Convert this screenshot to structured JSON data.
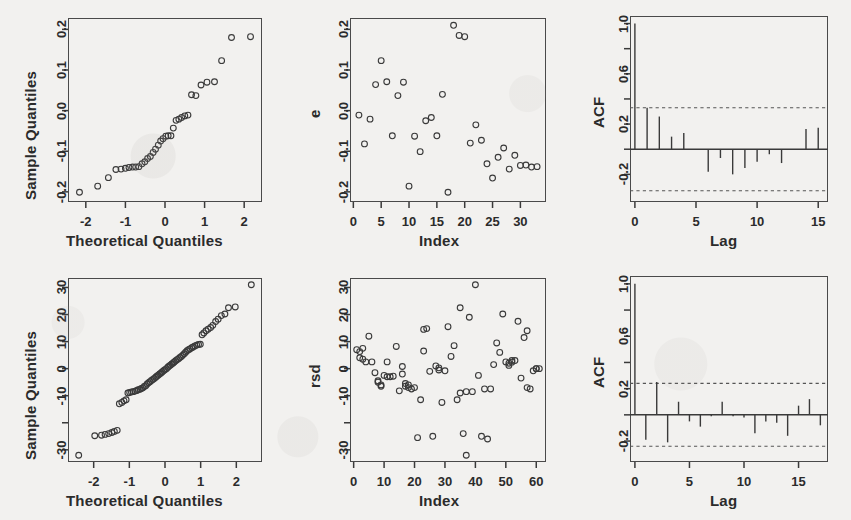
{
  "figure": {
    "kind": "r-diagnostic-panel-grid",
    "rows": 2,
    "cols": 3,
    "background_color": "#f2f1ef",
    "ink_color": "#3a3a3a"
  },
  "chart_data": [
    {
      "id": "top-left-qq",
      "type": "scatter",
      "title": "",
      "xlabel": "Theoretical Quantiles",
      "ylabel": "Sample Quantiles",
      "xlim": [
        -2.45,
        2.45
      ],
      "ylim": [
        -0.225,
        0.228
      ],
      "xticks": [
        -2,
        -1,
        0,
        1,
        2
      ],
      "xticklabels": [
        "-2",
        "-1",
        "0",
        "1",
        "2"
      ],
      "yticks": [
        -0.2,
        -0.1,
        0.0,
        0.1,
        0.2
      ],
      "yticklabels": [
        "-0.2",
        "-0.1",
        "0.0",
        "0.1",
        "0.2"
      ],
      "grid": false,
      "legend": "none",
      "marker": "open-circle",
      "x": [
        -2.16,
        -1.7,
        -1.43,
        -1.24,
        -1.11,
        -1.0,
        -0.91,
        -0.82,
        -0.74,
        -0.66,
        -0.58,
        -0.51,
        -0.44,
        -0.37,
        -0.3,
        -0.24,
        -0.17,
        -0.11,
        -0.05,
        0.02,
        0.08,
        0.15,
        0.21,
        0.28,
        0.35,
        0.42,
        0.5,
        0.58,
        0.67,
        0.78,
        0.91,
        1.06,
        1.25,
        1.43,
        1.68,
        2.16
      ],
      "y": [
        -0.201,
        -0.186,
        -0.165,
        -0.145,
        -0.144,
        -0.142,
        -0.14,
        -0.139,
        -0.139,
        -0.138,
        -0.131,
        -0.126,
        -0.118,
        -0.113,
        -0.103,
        -0.095,
        -0.085,
        -0.075,
        -0.069,
        -0.063,
        -0.062,
        -0.062,
        -0.043,
        -0.024,
        -0.021,
        -0.017,
        -0.013,
        -0.011,
        0.039,
        0.037,
        0.063,
        0.07,
        0.071,
        0.123,
        0.18,
        0.182,
        0.21
      ]
    },
    {
      "id": "top-middle-residuals",
      "type": "scatter",
      "title": "",
      "xlabel": "Index",
      "ylabel": "e",
      "xlim": [
        -0.6,
        34.6
      ],
      "ylim": [
        -0.225,
        0.228
      ],
      "xticks": [
        0,
        5,
        10,
        15,
        20,
        25,
        30
      ],
      "xticklabels": [
        "0",
        "5",
        "10",
        "15",
        "20",
        "25",
        "30"
      ],
      "yticks": [
        -0.2,
        -0.1,
        0.0,
        0.1,
        0.2
      ],
      "yticklabels": [
        "-0.2",
        "-0.1",
        "0.0",
        "0.1",
        "0.2"
      ],
      "grid": false,
      "legend": "none",
      "marker": "open-circle",
      "x": [
        1,
        2,
        3,
        4,
        5,
        6,
        7,
        8,
        9,
        10,
        11,
        12,
        13,
        14,
        15,
        16,
        17,
        18,
        19,
        20,
        21,
        22,
        23,
        24,
        25,
        26,
        27,
        28,
        29,
        30,
        31,
        32,
        33
      ],
      "y": [
        -0.011,
        -0.082,
        -0.021,
        0.064,
        0.123,
        0.071,
        -0.062,
        0.037,
        0.07,
        -0.186,
        -0.063,
        -0.101,
        -0.025,
        -0.017,
        -0.062,
        0.04,
        -0.201,
        0.21,
        0.185,
        0.182,
        -0.08,
        -0.035,
        -0.073,
        -0.131,
        -0.166,
        -0.115,
        -0.092,
        -0.144,
        -0.11,
        -0.135,
        -0.134,
        -0.139,
        -0.138
      ]
    },
    {
      "id": "top-right-acf",
      "type": "bar",
      "title": "",
      "xlabel": "Lag",
      "ylabel": "ACF",
      "xlim": [
        -0.4,
        15.8
      ],
      "ylim": [
        -0.42,
        1.06
      ],
      "xticks": [
        0,
        5,
        10,
        15
      ],
      "xticklabels": [
        "0",
        "5",
        "10",
        "15"
      ],
      "yticks": [
        -0.2,
        0.2,
        0.6,
        1.0
      ],
      "yticklabels": [
        "-0.2",
        "0.2",
        "0.6",
        "1.0"
      ],
      "grid": false,
      "legend": "none",
      "categories": [
        0,
        1,
        2,
        3,
        4,
        5,
        6,
        7,
        8,
        9,
        10,
        11,
        12,
        13,
        14,
        15
      ],
      "values": [
        1.0,
        0.33,
        0.26,
        0.1,
        0.13,
        0.0,
        -0.18,
        -0.07,
        -0.2,
        -0.15,
        -0.1,
        -0.04,
        -0.11,
        0.0,
        0.16,
        0.17
      ],
      "confidence_bounds": [
        0.33,
        -0.33
      ],
      "confidence_line_style": "dashed"
    },
    {
      "id": "bottom-left-qq",
      "type": "scatter",
      "title": "",
      "xlabel": "Theoretical Quantiles",
      "ylabel": "Sample Quantiles",
      "xlim": [
        -2.72,
        2.72
      ],
      "ylim": [
        -34.5,
        33.5
      ],
      "xticks": [
        -2,
        -1,
        0,
        1,
        2
      ],
      "xticklabels": [
        "-2",
        "-1",
        "0",
        "1",
        "2"
      ],
      "yticks": [
        -30,
        -10,
        0,
        10,
        20,
        30
      ],
      "yticklabels": [
        "-30",
        "-10",
        "0",
        "10",
        "20",
        "30"
      ],
      "grid": false,
      "legend": "none",
      "marker": "open-circle",
      "x": [
        -2.42,
        -1.97,
        -1.78,
        -1.68,
        -1.58,
        -1.49,
        -1.42,
        -1.34,
        -1.28,
        -1.21,
        -1.15,
        -1.09,
        -1.04,
        -0.99,
        -0.94,
        -0.89,
        -0.84,
        -0.79,
        -0.75,
        -0.7,
        -0.66,
        -0.62,
        -0.58,
        -0.54,
        -0.5,
        -0.46,
        -0.42,
        -0.38,
        -0.34,
        -0.3,
        -0.26,
        -0.23,
        -0.19,
        -0.15,
        -0.11,
        -0.08,
        -0.04,
        0.0,
        0.04,
        0.08,
        0.11,
        0.15,
        0.19,
        0.23,
        0.26,
        0.3,
        0.34,
        0.38,
        0.42,
        0.46,
        0.5,
        0.54,
        0.58,
        0.62,
        0.66,
        0.7,
        0.75,
        0.79,
        0.84,
        0.89,
        0.94,
        0.99,
        1.04,
        1.09,
        1.15,
        1.21,
        1.28,
        1.34,
        1.42,
        1.49,
        1.58,
        1.68,
        1.78,
        1.97,
        2.42
      ],
      "y": [
        -32.0,
        -24.8,
        -24.6,
        -24.3,
        -24.0,
        -23.6,
        -23.2,
        -22.8,
        -13.0,
        -12.5,
        -11.9,
        -11.5,
        -9.0,
        -8.8,
        -8.6,
        -8.5,
        -8.3,
        -8.1,
        -7.8,
        -7.6,
        -7.3,
        -7.1,
        -6.6,
        -6.3,
        -5.7,
        -5.2,
        -4.8,
        -4.4,
        -4.0,
        -3.6,
        -3.2,
        -2.8,
        -2.4,
        -2.0,
        -1.6,
        -1.2,
        -0.8,
        -0.4,
        0.0,
        0.5,
        0.9,
        1.3,
        1.7,
        2.1,
        2.5,
        2.9,
        3.3,
        3.7,
        4.1,
        4.5,
        5.0,
        5.5,
        6.1,
        6.6,
        7.0,
        7.3,
        7.7,
        8.0,
        8.4,
        8.7,
        8.9,
        9.0,
        12.5,
        13.2,
        14.0,
        14.6,
        15.2,
        16.0,
        17.4,
        18.3,
        19.6,
        20.2,
        22.5,
        22.8,
        31.0
      ]
    },
    {
      "id": "bottom-middle-residuals",
      "type": "scatter",
      "title": "",
      "xlabel": "Index",
      "ylabel": "rsd",
      "xlim": [
        -1.2,
        63.2
      ],
      "ylim": [
        -34.5,
        33.5
      ],
      "xticks": [
        0,
        10,
        20,
        30,
        40,
        50,
        60
      ],
      "xticklabels": [
        "0",
        "10",
        "20",
        "30",
        "40",
        "50",
        "60"
      ],
      "yticks": [
        -30,
        -10,
        0,
        10,
        20,
        30
      ],
      "yticklabels": [
        "-30",
        "-10",
        "0",
        "10",
        "20",
        "30"
      ],
      "grid": false,
      "legend": "none",
      "marker": "open-circle",
      "x": [
        1,
        2,
        2,
        3,
        3,
        4,
        5,
        6,
        7,
        8,
        8,
        9,
        9,
        10,
        11,
        11,
        12,
        13,
        14,
        15,
        16,
        16,
        17,
        17,
        18,
        18,
        19,
        20,
        21,
        22,
        23,
        23,
        24,
        25,
        26,
        27,
        28,
        28,
        29,
        30,
        31,
        32,
        33,
        34,
        35,
        35,
        36,
        37,
        37,
        38,
        39,
        40,
        41,
        42,
        43,
        44,
        45,
        46,
        47,
        48,
        49,
        50,
        51,
        51,
        52,
        52,
        53,
        54,
        55,
        56,
        57,
        57,
        58,
        59,
        60,
        60,
        61
      ],
      "y": [
        7.0,
        6.3,
        4.0,
        7.5,
        3.5,
        2.5,
        12.0,
        2.5,
        -1.5,
        -4.5,
        -5.0,
        -6.0,
        -6.5,
        -2.5,
        2.5,
        -3.0,
        -3.0,
        -2.8,
        8.2,
        -8.2,
        0.8,
        -2.0,
        -5.5,
        -6.5,
        -6.0,
        -7.0,
        -7.5,
        -7.0,
        -25.5,
        -11.5,
        6.5,
        14.5,
        14.8,
        -1.0,
        -25.0,
        1.0,
        -0.5,
        0.3,
        -12.5,
        -0.8,
        15.5,
        4.5,
        8.5,
        -11.5,
        22.5,
        -9.0,
        -24.0,
        -32.0,
        -8.5,
        19.0,
        -8.5,
        31.0,
        -2.5,
        -25.0,
        -7.5,
        -26.0,
        -7.5,
        1.5,
        9.5,
        6.0,
        20.2,
        2.5,
        2.0,
        1.2,
        3.0,
        2.4,
        3.0,
        17.5,
        -3.5,
        11.5,
        14.0,
        -7.0,
        -7.5,
        -0.8,
        0.0,
        0.0,
        0.0
      ]
    },
    {
      "id": "bottom-right-acf",
      "type": "bar",
      "title": "",
      "xlabel": "Lag",
      "ylabel": "ACF",
      "xlim": [
        -0.45,
        17.7
      ],
      "ylim": [
        -0.36,
        1.06
      ],
      "xticks": [
        0,
        5,
        10,
        15
      ],
      "xticklabels": [
        "0",
        "5",
        "10",
        "15"
      ],
      "yticks": [
        -0.2,
        0.2,
        0.6,
        1.0
      ],
      "yticklabels": [
        "-0.2",
        "0.2",
        "0.6",
        "1.0"
      ],
      "grid": false,
      "legend": "none",
      "categories": [
        0,
        1,
        2,
        3,
        4,
        5,
        6,
        7,
        8,
        9,
        10,
        11,
        12,
        13,
        14,
        15,
        16,
        17
      ],
      "values": [
        1.0,
        -0.19,
        0.25,
        -0.21,
        0.1,
        -0.05,
        -0.09,
        -0.01,
        0.1,
        -0.01,
        -0.02,
        -0.14,
        -0.05,
        -0.06,
        -0.16,
        0.07,
        0.12,
        -0.08
      ],
      "confidence_bounds": [
        0.24,
        -0.24
      ],
      "confidence_line_style": "dashed"
    }
  ],
  "labels": {
    "sample_quantiles": "Sample Quantiles",
    "theoretical_quantiles": "Theoretical Quantiles",
    "index": "Index",
    "acf": "ACF",
    "lag": "Lag",
    "e": "e",
    "rsd": "rsd"
  }
}
